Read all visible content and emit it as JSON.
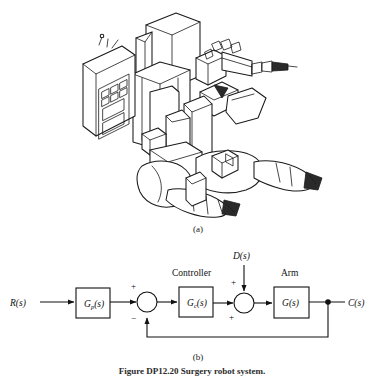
{
  "figure": {
    "panel_a_label": "(a)",
    "panel_b_label": "(b)",
    "caption": "Figure  DP12.20   Surgery robot system.",
    "photo_alt": "surgical robot line drawing"
  },
  "block_diagram": {
    "type": "control-block-diagram",
    "input_signal": "R(s)",
    "output_signal": "C(s)",
    "disturbance_signal": "D(s)",
    "blocks": [
      {
        "id": "gp",
        "label": "G",
        "subscript": "p",
        "suffix": "(s)",
        "title": ""
      },
      {
        "id": "gc",
        "label": "G",
        "subscript": "c",
        "suffix": "(s)",
        "title": "Controller"
      },
      {
        "id": "g",
        "label": "G",
        "subscript": "",
        "suffix": "(s)",
        "title": "Arm"
      }
    ],
    "summing_junctions": [
      {
        "id": "sum1",
        "signs": {
          "top": "+",
          "bottom": "−"
        }
      },
      {
        "id": "sum2",
        "signs": {
          "top": "+",
          "bottom": "+"
        }
      }
    ],
    "feedback": "unity negative feedback from C(s) to first summing junction",
    "colors": {
      "line": "#111111",
      "background": "#ffffff"
    }
  }
}
